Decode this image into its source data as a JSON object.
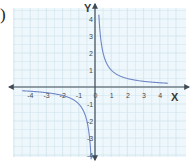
{
  "label": ")",
  "colors": {
    "background": "#ffffff",
    "grid_background": "#eef7fb",
    "grid_line": "#cfe3ec",
    "axis": "#3f4a55",
    "curve": "#6f86c6",
    "text": "#4a4a4a"
  },
  "chart_data": {
    "type": "line",
    "title": "",
    "function": "y = 1/x",
    "xlabel": "X",
    "ylabel": "Y",
    "xlim": [
      -4.5,
      4.5
    ],
    "ylim": [
      -4.5,
      4.5
    ],
    "grid": true,
    "legend": null,
    "x_ticks": [
      -4,
      -3,
      -2,
      -1,
      0,
      1,
      2,
      3,
      4
    ],
    "x_tick_labels": [
      "-4",
      "-3",
      "-2",
      "-1",
      "0",
      "1",
      "2",
      "3",
      "4"
    ],
    "y_ticks": [
      -4,
      -3,
      -2,
      -1,
      1,
      2,
      3,
      4
    ],
    "y_tick_labels": [
      "-4",
      "-3",
      "-2",
      "-1",
      "1",
      "2",
      "3",
      "4"
    ],
    "series": [
      {
        "name": "branch-positive",
        "x": [
          0.45,
          0.5,
          0.75,
          1,
          1.5,
          2,
          2.5,
          3,
          3.5,
          4,
          4.5
        ],
        "y": [
          4.4,
          4.0,
          1.33,
          1.0,
          0.67,
          0.5,
          0.4,
          0.33,
          0.29,
          0.25,
          0.22
        ]
      },
      {
        "name": "branch-negative",
        "x": [
          -4.5,
          -4,
          -3.5,
          -3,
          -2.5,
          -2,
          -1.5,
          -1,
          -0.75,
          -0.5,
          -0.45
        ],
        "y": [
          -0.22,
          -0.25,
          -0.29,
          -0.33,
          -0.4,
          -0.5,
          -0.67,
          -1.0,
          -1.33,
          -2.0,
          -4.4
        ]
      }
    ]
  }
}
